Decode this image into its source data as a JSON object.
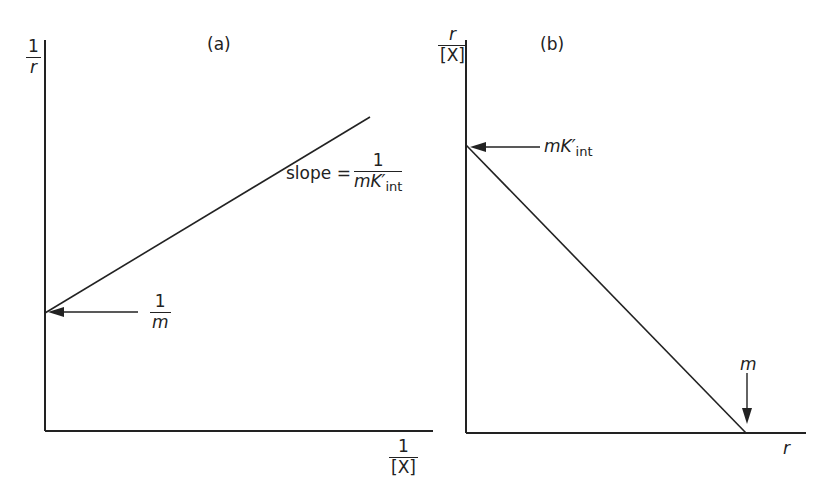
{
  "panel_a": {
    "label": "(a)",
    "y_axis_label": {
      "numerator": "1",
      "denominator": "r"
    },
    "x_axis_label": {
      "numerator": "1",
      "denominator": "[X]"
    },
    "slope_annotation": {
      "prefix": "slope =",
      "numerator": "1",
      "denominator_main": "mK′",
      "denominator_sub": "int"
    },
    "intercept_annotation": {
      "numerator": "1",
      "denominator": "m"
    }
  },
  "panel_b": {
    "label": "(b)",
    "y_axis_label": {
      "numerator": "r",
      "denominator": "[X]"
    },
    "x_axis_label": "r",
    "y_intercept_annotation": {
      "main": "mK′",
      "sub": "int"
    },
    "x_intercept_annotation": "m"
  },
  "colors": {
    "ink": "#222222",
    "background": "#ffffff"
  }
}
